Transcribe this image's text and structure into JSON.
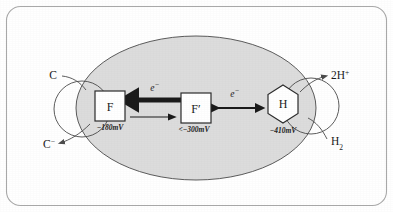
{
  "figure": {
    "frame": {
      "stroke_color": "#a9a9a9"
    },
    "membrane": {
      "name": "membrane-vesicle",
      "fill_color": "#dcdcdc",
      "stroke_color": "#4a4a4a"
    }
  },
  "nodes": [
    {
      "id": "f",
      "shape": "square",
      "label": "F",
      "potential": "−180mV",
      "cx": 110,
      "cy": 106,
      "size": 30
    },
    {
      "id": "f-prime",
      "shape": "square",
      "label": "F′",
      "potential": "<−300mV",
      "cx": 196,
      "cy": 108,
      "size": 30
    },
    {
      "id": "h",
      "shape": "hexagon",
      "label": "H",
      "potential": "−410mV",
      "cx": 283,
      "cy": 104,
      "size": 34
    }
  ],
  "arrows": [
    {
      "id": "electron-f-prime-to-f",
      "label": "e⁻",
      "style": "thick",
      "direction": "left",
      "from": "f-prime",
      "to": "f"
    },
    {
      "id": "return-f-to-f-prime",
      "label": "",
      "style": "thin",
      "direction": "right",
      "from": "f",
      "to": "f-prime"
    },
    {
      "id": "electron-f-prime-to-h",
      "label": "e⁻",
      "style": "double",
      "direction": "both",
      "from": "f-prime",
      "to": "h"
    }
  ],
  "species": {
    "substrate_in": {
      "name": "substrate-c",
      "base": "C",
      "charge": ""
    },
    "substrate_out": {
      "name": "substrate-c-minus",
      "base": "C",
      "charge": "−"
    },
    "proton": {
      "name": "proton-2h-plus",
      "base": "2H",
      "charge": "+"
    },
    "hydrogen": {
      "name": "hydrogen-gas",
      "base": "H",
      "charge": "2"
    }
  },
  "electron_symbol": {
    "base": "e",
    "charge": "−"
  }
}
